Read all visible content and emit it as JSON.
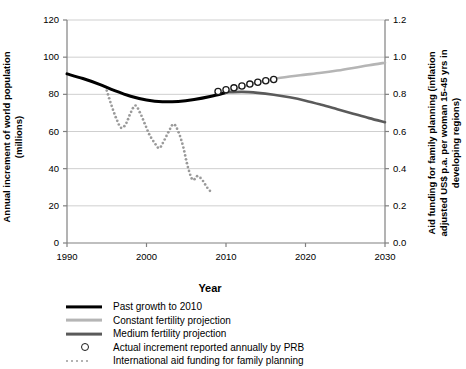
{
  "chart_data": {
    "type": "line",
    "title": "",
    "xlabel": "Year",
    "ylabel": "Annual increment of world population (millions)",
    "ylabel_right": "Aid funding for family planning (inflation adjusted US$ p.a. per woman 15-45 yrs in developing regions)",
    "xlim": [
      1990,
      2030
    ],
    "ylim": [
      0,
      120
    ],
    "ylim_right": [
      0.0,
      1.2
    ],
    "xticks": [
      1990,
      2000,
      2010,
      2020,
      2030
    ],
    "xtick_labels": [
      "1990",
      "2000",
      "2010",
      "2020",
      "2030"
    ],
    "yticks": [
      0,
      20,
      40,
      60,
      80,
      100,
      120
    ],
    "ytick_labels": [
      "0",
      "20",
      "40",
      "60",
      "80",
      "100",
      "120"
    ],
    "yticks_right": [
      0.0,
      0.2,
      0.4,
      0.6,
      0.8,
      1.0,
      1.2
    ],
    "ytick_labels_right": [
      "0.0",
      "0.2",
      "0.4",
      "0.6",
      "0.8",
      "1.0",
      "1.2"
    ],
    "grid": true,
    "grid_axis": "y",
    "legend_position": "below",
    "series": [
      {
        "name": "Past growth to 2010",
        "style": "solid",
        "color": "#000000",
        "width": 3.0,
        "axis": "left",
        "x": [
          1990,
          1992,
          1994,
          1996,
          1998,
          2000,
          2002,
          2004,
          2006,
          2008,
          2010
        ],
        "values": [
          91,
          88.5,
          85.5,
          82,
          79,
          77,
          76,
          76.2,
          77.2,
          78.8,
          81
        ]
      },
      {
        "name": "Constant fertility projection",
        "style": "solid",
        "color": "#b5b5b5",
        "width": 2.6,
        "axis": "left",
        "x": [
          2010,
          2012,
          2014,
          2016,
          2018,
          2020,
          2022,
          2024,
          2026,
          2028,
          2030
        ],
        "values": [
          81,
          84,
          86.5,
          88.3,
          89.6,
          90.6,
          91.6,
          92.8,
          94.2,
          95.7,
          97
        ]
      },
      {
        "name": "Medium fertility projection",
        "style": "solid",
        "color": "#5a5a5a",
        "width": 2.6,
        "axis": "left",
        "x": [
          2010,
          2012,
          2014,
          2016,
          2018,
          2020,
          2022,
          2024,
          2026,
          2028,
          2030
        ],
        "values": [
          81,
          81.3,
          80.8,
          79.8,
          78.4,
          76.6,
          74.4,
          72.0,
          69.6,
          67.2,
          65
        ]
      },
      {
        "name": "Actual increment reported annually by PRB",
        "style": "markers",
        "marker": "circle-open",
        "color": "#1a1a1a",
        "axis": "left",
        "x": [
          2009,
          2010,
          2011,
          2012,
          2013,
          2014,
          2015,
          2016
        ],
        "values": [
          81.5,
          82.5,
          83.5,
          84.5,
          85.5,
          86.5,
          87.3,
          88.0
        ]
      },
      {
        "name": "International aid funding for family planning",
        "style": "dotted",
        "color": "#9a9a9a",
        "axis": "right",
        "x": [
          1995,
          1995.6,
          1996.2,
          1996.8,
          1997.4,
          1998,
          1998.6,
          1999.2,
          1999.8,
          2000.4,
          2001,
          2001.6,
          2002.2,
          2002.8,
          2003.4,
          2004,
          2004.6,
          2005.2,
          2005.8,
          2006.4,
          2007,
          2007.6,
          2008
        ],
        "values": [
          0.82,
          0.74,
          0.67,
          0.62,
          0.64,
          0.7,
          0.74,
          0.7,
          0.64,
          0.58,
          0.54,
          0.51,
          0.55,
          0.6,
          0.64,
          0.6,
          0.52,
          0.41,
          0.34,
          0.36,
          0.34,
          0.3,
          0.28
        ]
      }
    ]
  },
  "legend": {
    "items": [
      {
        "label": "Past growth to 2010",
        "swatch": "solid-black-line"
      },
      {
        "label": "Constant fertility projection",
        "swatch": "solid-lightgray-line"
      },
      {
        "label": "Medium fertility projection",
        "swatch": "solid-gray-line"
      },
      {
        "label": "Actual increment reported annually by PRB",
        "swatch": "open-circle-marker"
      },
      {
        "label": "International aid funding for family planning",
        "swatch": "dotted-gray-line"
      }
    ]
  },
  "colors": {
    "past_growth": "#000000",
    "constant_fertility": "#b5b5b5",
    "medium_fertility": "#5a5a5a",
    "aid_funding": "#9a9a9a",
    "grid": "#cfcfcf",
    "axis": "#808080",
    "text": "#000000"
  }
}
